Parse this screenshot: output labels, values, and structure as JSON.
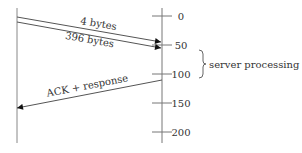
{
  "diagram": {
    "type": "timeline-sequence",
    "colors": {
      "line": "#555555",
      "axis": "#666666",
      "text": "#333333",
      "arrowhead": "#111111"
    },
    "messages": [
      {
        "label": "4 bytes",
        "direction": "client-to-server",
        "start_y": 17,
        "end_y": 42
      },
      {
        "label": "396 bytes",
        "direction": "client-to-server",
        "start_y": 22,
        "end_y": 48
      },
      {
        "label": "ACK + response",
        "direction": "server-to-client",
        "start_y": 80,
        "end_y": 108
      }
    ],
    "time_axis": {
      "ticks": [
        {
          "label": "0",
          "y": 16
        },
        {
          "label": "50",
          "y": 45
        },
        {
          "label": "100",
          "y": 74
        },
        {
          "label": "150",
          "y": 103
        },
        {
          "label": "200",
          "y": 132
        }
      ]
    },
    "annotation": {
      "label": "server processing",
      "brace_from_y": 50,
      "brace_to_y": 78
    }
  }
}
